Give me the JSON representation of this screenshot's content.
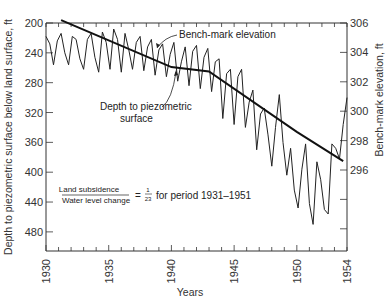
{
  "chart_data": {
    "type": "line",
    "title": "",
    "xlabel": "Years",
    "ylabel": "Depth to piezometric surface below land surface, ft",
    "y2label": "Bench-mark elevation, ft",
    "xlim": [
      1930,
      1954
    ],
    "ylim": [
      200,
      500
    ],
    "ylim_inverted": true,
    "y2lim": [
      293.5,
      306
    ],
    "x_ticks": [
      "1930",
      "1935",
      "1940",
      "1945",
      "1950",
      "1954"
    ],
    "y_ticks": [
      "200",
      "240",
      "280",
      "320",
      "360",
      "400",
      "440",
      "480"
    ],
    "y2_ticks": [
      "306",
      "304",
      "302",
      "300",
      "298",
      "296"
    ],
    "grid": false,
    "series": [
      {
        "name": "Depth to piezometric surface",
        "axis": "left",
        "x": [
          1930.0,
          1930.3,
          1930.6,
          1930.9,
          1931.2,
          1931.5,
          1931.8,
          1932.1,
          1932.4,
          1932.7,
          1933.0,
          1933.3,
          1933.6,
          1933.9,
          1934.2,
          1934.5,
          1934.8,
          1935.1,
          1935.4,
          1935.7,
          1936.0,
          1936.3,
          1936.6,
          1936.9,
          1937.2,
          1937.5,
          1937.8,
          1938.1,
          1938.4,
          1938.7,
          1939.0,
          1939.3,
          1939.6,
          1939.9,
          1940.2,
          1940.5,
          1940.8,
          1941.1,
          1941.4,
          1941.7,
          1942.0,
          1942.3,
          1942.6,
          1942.9,
          1943.2,
          1943.5,
          1943.8,
          1944.1,
          1944.4,
          1944.7,
          1945.0,
          1945.3,
          1945.6,
          1945.9,
          1946.2,
          1946.5,
          1946.8,
          1947.1,
          1947.4,
          1947.7,
          1948.0,
          1948.3,
          1948.6,
          1948.9,
          1949.2,
          1949.5,
          1949.8,
          1950.1,
          1950.4,
          1950.7,
          1951.0,
          1951.3,
          1951.6,
          1951.9,
          1952.2,
          1952.5,
          1952.8,
          1953.1,
          1953.4,
          1953.7,
          1954.0
        ],
        "values": [
          218,
          228,
          256,
          224,
          214,
          240,
          256,
          218,
          222,
          248,
          262,
          222,
          214,
          246,
          266,
          212,
          226,
          262,
          208,
          222,
          266,
          214,
          236,
          262,
          226,
          218,
          264,
          232,
          222,
          270,
          236,
          228,
          272,
          242,
          226,
          278,
          252,
          232,
          284,
          238,
          230,
          288,
          246,
          234,
          292,
          252,
          248,
          328,
          268,
          262,
          336,
          272,
          262,
          340,
          306,
          290,
          370,
          322,
          314,
          350,
          392,
          340,
          296,
          360,
          404,
          368,
          424,
          448,
          396,
          362,
          442,
          470,
          386,
          410,
          450,
          456,
          362,
          368,
          382,
          336,
          300
        ],
        "color": "#222222"
      },
      {
        "name": "Bench-mark elevation",
        "axis": "right",
        "x": [
          1931.2,
          1940.0,
          1943.0,
          1950.0,
          1953.7
        ],
        "values": [
          306.2,
          303.0,
          302.7,
          298.6,
          296.6
        ],
        "color": "#111111"
      }
    ],
    "annotations": [
      {
        "text": "Bench-mark elevation",
        "points_to": "bench-mark line near 1938"
      },
      {
        "text": "Depth to piezometric surface",
        "points_to": "hydrograph near 1940"
      },
      {
        "text": "Land subsidence / Water level change = 1/23 for period 1931–1951"
      }
    ]
  },
  "labels": {
    "xlabel": "Years",
    "ylabel": "Depth to piezometric surface below land surface, ft",
    "y2label": "Bench-mark elevation, ft",
    "bench_mark": "Bench-mark elevation",
    "depth_line1": "Depth to piezometric",
    "depth_line2": "surface",
    "ratio_numerator": "Land subsidence",
    "ratio_denominator": "Water level change",
    "ratio_equals": "=",
    "ratio_value_num": "1",
    "ratio_value_den": "23",
    "ratio_suffix": "for period 1931–1951"
  }
}
